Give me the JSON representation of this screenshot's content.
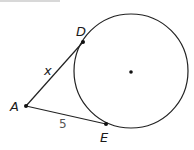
{
  "diagram": {
    "points": {
      "A": "A",
      "D": "D",
      "E": "E"
    },
    "segment_AD_label": "x",
    "segment_AE_label": "5",
    "circle": {
      "has_center_dot": true
    }
  }
}
